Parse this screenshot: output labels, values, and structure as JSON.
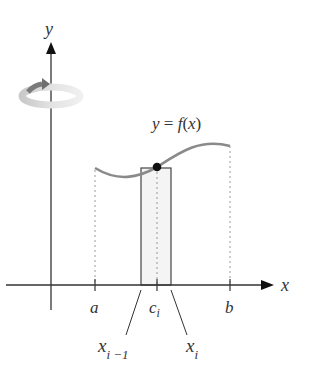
{
  "diagram": {
    "axes": {
      "x_label": "x",
      "y_label": "y"
    },
    "curve_label": "y = f(x)",
    "tick_labels": {
      "a": "a",
      "c": "c",
      "c_sub": "i",
      "b": "b"
    },
    "callouts": {
      "left": {
        "base": "x",
        "sub": "i −1"
      },
      "right": {
        "base": "x",
        "sub": "i"
      }
    },
    "icons": [
      "rotation-arrow-icon"
    ],
    "colors": {
      "axis": "#333333",
      "curve": "#8a8a8a",
      "rectangle_stroke": "#444444",
      "rectangle_fill": "#f4f4f4",
      "dotted": "#999999",
      "point": "#111111",
      "rotation_arrow": "#b5b5b5"
    }
  }
}
